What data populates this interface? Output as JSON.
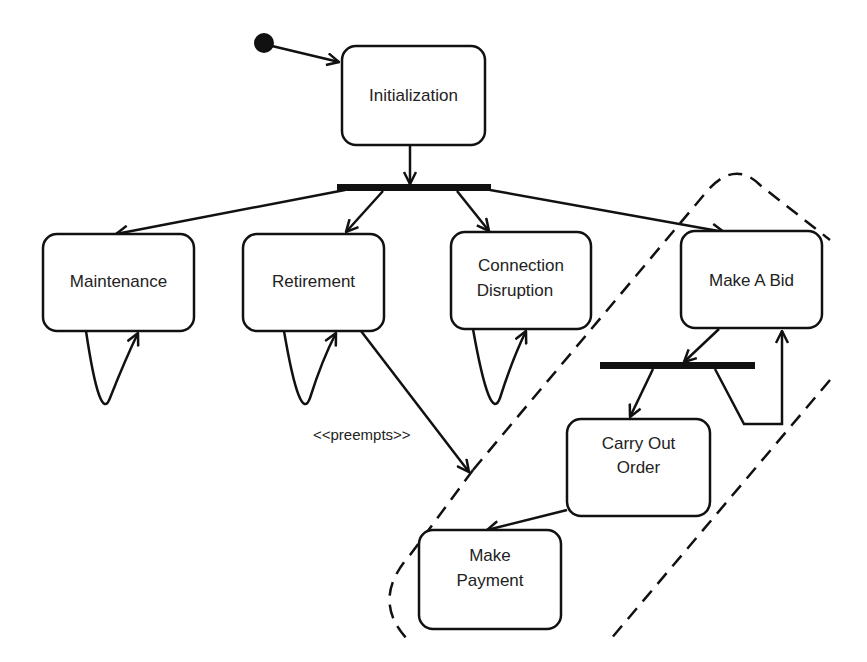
{
  "diagram": {
    "type": "UML state/activity diagram",
    "initial_state": "filled-circle",
    "states": [
      {
        "id": "initialization",
        "label": "Initialization"
      },
      {
        "id": "maintenance",
        "label": "Maintenance"
      },
      {
        "id": "retirement",
        "label": "Retirement"
      },
      {
        "id": "connection_disruption",
        "label_line1": "Connection",
        "label_line2": "Disruption"
      },
      {
        "id": "make_a_bid",
        "label": "Make A Bid"
      },
      {
        "id": "carry_out_order",
        "label_line1": "Carry Out",
        "label_line2": "Order"
      },
      {
        "id": "make_payment",
        "label_line1": "Make",
        "label_line2": "Payment"
      }
    ],
    "fork_bars": [
      "fork-after-initialization",
      "fork-after-make-a-bid"
    ],
    "edges": [
      {
        "from": "initial",
        "to": "initialization"
      },
      {
        "from": "initialization",
        "to": "fork-after-initialization"
      },
      {
        "from": "fork-after-initialization",
        "to": "maintenance"
      },
      {
        "from": "fork-after-initialization",
        "to": "retirement"
      },
      {
        "from": "fork-after-initialization",
        "to": "connection_disruption"
      },
      {
        "from": "fork-after-initialization",
        "to": "make_a_bid"
      },
      {
        "from": "maintenance",
        "to": "maintenance",
        "kind": "self-loop"
      },
      {
        "from": "retirement",
        "to": "retirement",
        "kind": "self-loop"
      },
      {
        "from": "connection_disruption",
        "to": "connection_disruption",
        "kind": "self-loop"
      },
      {
        "from": "make_a_bid",
        "to": "fork-after-make-a-bid"
      },
      {
        "from": "fork-after-make-a-bid",
        "to": "carry_out_order"
      },
      {
        "from": "fork-after-make-a-bid",
        "to": "make_a_bid",
        "kind": "loop-back"
      },
      {
        "from": "carry_out_order",
        "to": "make_payment"
      },
      {
        "from": "retirement",
        "to": "bidding-region",
        "stereotype": "<<preempts>>"
      }
    ],
    "region": "dashed interruptible region around Make A Bid, Carry Out Order, Make Payment",
    "preempts_label": "<<preempts>>"
  }
}
